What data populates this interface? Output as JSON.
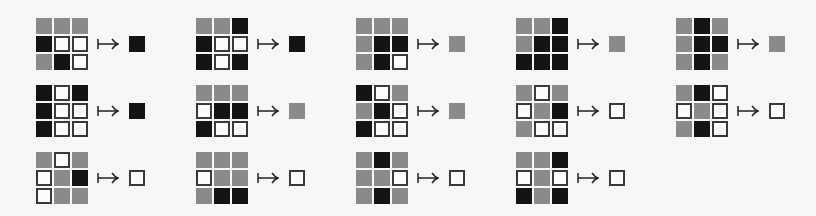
{
  "figure": {
    "legend": {
      "g": "gray",
      "b": "black",
      "w": "white"
    },
    "colors": {
      "gray": "#8a8a8a",
      "black": "#141414",
      "white": "#fbfbfb",
      "outline": "#3a3a3a"
    },
    "arrow_symbol": "↦",
    "columns": [
      {
        "rules": [
          {
            "grid": [
              "g",
              "g",
              "g",
              "b",
              "w",
              "w",
              "g",
              "b",
              "w"
            ],
            "output": "b"
          },
          {
            "grid": [
              "b",
              "w",
              "b",
              "b",
              "w",
              "w",
              "b",
              "w",
              "w"
            ],
            "output": "b"
          },
          {
            "grid": [
              "g",
              "w",
              "g",
              "w",
              "g",
              "b",
              "w",
              "g",
              "g"
            ],
            "output": "w"
          }
        ]
      },
      {
        "rules": [
          {
            "grid": [
              "g",
              "g",
              "b",
              "b",
              "w",
              "w",
              "b",
              "w",
              "b"
            ],
            "output": "b"
          },
          {
            "grid": [
              "g",
              "g",
              "g",
              "w",
              "b",
              "b",
              "b",
              "w",
              "w"
            ],
            "output": "g"
          },
          {
            "grid": [
              "g",
              "g",
              "g",
              "w",
              "g",
              "g",
              "g",
              "b",
              "b"
            ],
            "output": "w"
          }
        ]
      },
      {
        "rules": [
          {
            "grid": [
              "g",
              "g",
              "g",
              "g",
              "b",
              "b",
              "g",
              "b",
              "w"
            ],
            "output": "g"
          },
          {
            "grid": [
              "b",
              "w",
              "g",
              "g",
              "b",
              "w",
              "b",
              "w",
              "w"
            ],
            "output": "g"
          },
          {
            "grid": [
              "g",
              "b",
              "g",
              "g",
              "g",
              "w",
              "g",
              "b",
              "g"
            ],
            "output": "w"
          }
        ]
      },
      {
        "rules": [
          {
            "grid": [
              "g",
              "g",
              "b",
              "g",
              "b",
              "b",
              "b",
              "b",
              "b"
            ],
            "output": "g"
          },
          {
            "grid": [
              "g",
              "w",
              "g",
              "w",
              "g",
              "b",
              "g",
              "w",
              "w"
            ],
            "output": "w"
          },
          {
            "grid": [
              "g",
              "g",
              "b",
              "w",
              "g",
              "w",
              "b",
              "g",
              "b"
            ],
            "output": "w"
          }
        ]
      },
      {
        "rules": [
          {
            "grid": [
              "g",
              "b",
              "g",
              "g",
              "b",
              "b",
              "g",
              "b",
              "g"
            ],
            "output": "g"
          },
          {
            "grid": [
              "g",
              "b",
              "w",
              "w",
              "g",
              "w",
              "g",
              "b",
              "w"
            ],
            "output": "w"
          }
        ]
      }
    ]
  }
}
